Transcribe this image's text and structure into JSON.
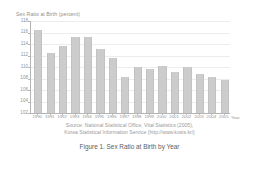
{
  "figure": {
    "caption": "Figure 1. Sex Ratio at Birth by Year",
    "source_lines": [
      "Source: National Statistical Office, Vital Statistics (2005),",
      "Korea Statistical Information Service (http://www.kosis.kr/)"
    ]
  },
  "chart_data": {
    "type": "bar",
    "title": "Sex Ratio at Birth (percent)",
    "xlabel": "Year",
    "ylabel": "Sex Ratio at Birth (percent)",
    "x_unit_label": "Year",
    "categories": [
      "1990",
      "1991",
      "1992",
      "1993",
      "1994",
      "1995",
      "1996",
      "1997",
      "1998",
      "1999",
      "2000",
      "2001",
      "2002",
      "2003",
      "2004",
      "2005"
    ],
    "values": [
      116.5,
      112.4,
      113.6,
      115.3,
      115.2,
      113.2,
      111.6,
      108.2,
      110.0,
      109.6,
      110.2,
      109.1,
      110.0,
      108.7,
      108.2,
      107.8
    ],
    "ylim": [
      102,
      118
    ],
    "yticks": [
      102,
      104,
      106,
      108,
      110,
      112,
      114,
      116,
      118
    ],
    "ytick_labels": [
      "102",
      "104",
      "106",
      "108",
      "110",
      "112",
      "114",
      "116",
      "118"
    ],
    "grid": true,
    "legend": false,
    "bar_color": "#cccccc",
    "axis_color": "#b4b4b4",
    "grid_color": "#ededed",
    "text_color": "#949494"
  }
}
